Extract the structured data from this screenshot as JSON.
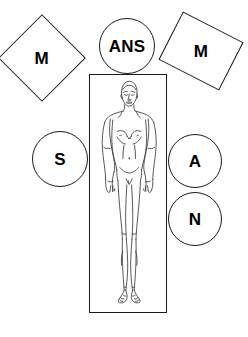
{
  "diagram": {
    "background_color": "#ffffff",
    "stroke_color": "#1a1a1a",
    "label_color": "#000000",
    "canvas": {
      "width": 248,
      "height": 337
    },
    "body_panel": {
      "name": "body-frame",
      "shape": "rectangle",
      "figure": "standing-human-figure-front-view",
      "figure_description": "Line drawing of a nude adult human figure, front view, arms at sides, bald head with eyes closed"
    },
    "tokens": [
      {
        "id": "m-left",
        "label": "M",
        "shape": "rotated-square",
        "rotation_deg": 45,
        "position": "upper-left"
      },
      {
        "id": "m-right",
        "label": "M",
        "shape": "rotated-rectangle",
        "rotation_deg": 27,
        "position": "upper-right"
      },
      {
        "id": "ans",
        "label": "ANS",
        "shape": "circle",
        "rotation_deg": 0,
        "position": "top-center"
      },
      {
        "id": "s",
        "label": "S",
        "shape": "circle",
        "rotation_deg": 0,
        "position": "middle-left"
      },
      {
        "id": "a",
        "label": "A",
        "shape": "circle",
        "rotation_deg": 0,
        "position": "middle-right-upper"
      },
      {
        "id": "n",
        "label": "N",
        "shape": "circle",
        "rotation_deg": 0,
        "position": "middle-right-lower"
      }
    ]
  }
}
